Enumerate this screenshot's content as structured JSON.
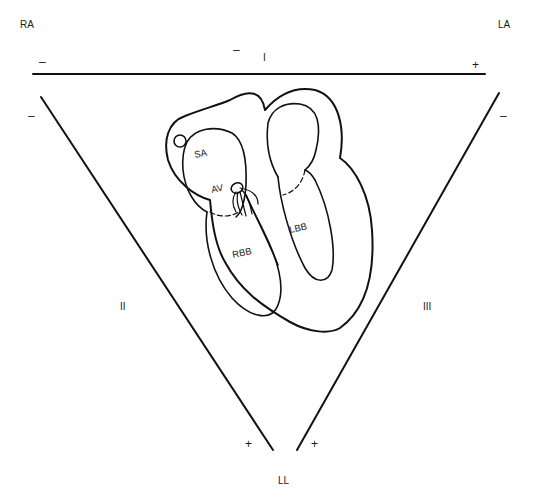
{
  "diagram": {
    "electrodes": {
      "right_arm": "RA",
      "left_arm": "LA",
      "left_leg": "LL"
    },
    "leads": {
      "lead_1": {
        "label": "I",
        "negative": "–",
        "positive": "+"
      },
      "lead_2": {
        "label": "II",
        "negative": "–",
        "positive": "+"
      },
      "lead_3": {
        "label": "III",
        "negative": "–",
        "positive": "+"
      }
    },
    "lead_1_center_sign": "–",
    "heart": {
      "sa_node": "SA",
      "av_node": "AV",
      "right_bundle_branch": "RBB",
      "left_bundle_branch": "LBB"
    }
  }
}
